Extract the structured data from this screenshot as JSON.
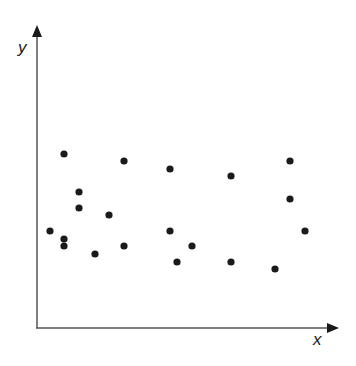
{
  "chart_data": {
    "type": "scatter",
    "title": "",
    "xlabel": "x",
    "ylabel": "y",
    "grid": false,
    "ticks": false,
    "legend": null,
    "xlim": [
      0,
      100
    ],
    "ylim": [
      0,
      100
    ],
    "points_pixel": [
      [
        64,
        154
      ],
      [
        124,
        161
      ],
      [
        170,
        169
      ],
      [
        231,
        176
      ],
      [
        290,
        161
      ],
      [
        79,
        192
      ],
      [
        79,
        208
      ],
      [
        290,
        199
      ],
      [
        109,
        215
      ],
      [
        50,
        231
      ],
      [
        170,
        231
      ],
      [
        305,
        231
      ],
      [
        64,
        239
      ],
      [
        64,
        246
      ],
      [
        124,
        246
      ],
      [
        192,
        246
      ],
      [
        95,
        254
      ],
      [
        177,
        262
      ],
      [
        231,
        262
      ],
      [
        275,
        269
      ]
    ],
    "points": [
      {
        "x": 9,
        "y": 58
      },
      {
        "x": 29,
        "y": 56
      },
      {
        "x": 45,
        "y": 53
      },
      {
        "x": 65,
        "y": 51
      },
      {
        "x": 85,
        "y": 56
      },
      {
        "x": 14,
        "y": 45
      },
      {
        "x": 14,
        "y": 40
      },
      {
        "x": 85,
        "y": 43
      },
      {
        "x": 24,
        "y": 38
      },
      {
        "x": 4,
        "y": 32
      },
      {
        "x": 45,
        "y": 32
      },
      {
        "x": 90,
        "y": 32
      },
      {
        "x": 9,
        "y": 30
      },
      {
        "x": 9,
        "y": 27
      },
      {
        "x": 29,
        "y": 27
      },
      {
        "x": 52,
        "y": 27
      },
      {
        "x": 20,
        "y": 25
      },
      {
        "x": 47,
        "y": 22
      },
      {
        "x": 65,
        "y": 22
      },
      {
        "x": 80,
        "y": 20
      }
    ],
    "colors": {
      "axis": "#444444",
      "point": "#1a1a1a"
    }
  }
}
